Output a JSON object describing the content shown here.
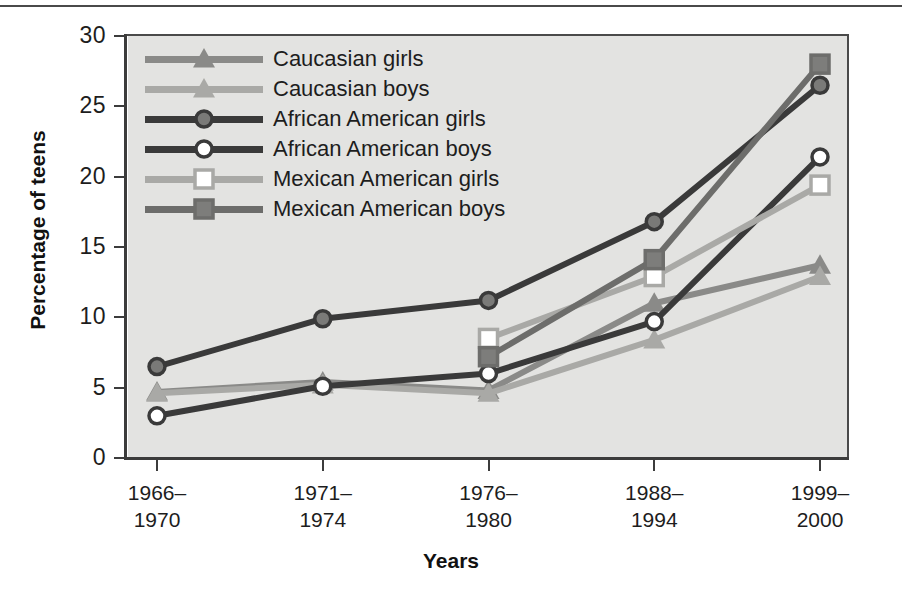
{
  "chart_data": {
    "type": "line",
    "title": "",
    "xlabel": "Years",
    "ylabel": "Percentage of teens",
    "categories": [
      "1966–1970",
      "1971–1974",
      "1976–1980",
      "1988–1994",
      "1999–2000"
    ],
    "category_lines": [
      [
        "1966–",
        "1970"
      ],
      [
        "1971–",
        "1974"
      ],
      [
        "1976–",
        "1980"
      ],
      [
        "1988–",
        "1994"
      ],
      [
        "1999–",
        "2000"
      ]
    ],
    "ylim": [
      0,
      30
    ],
    "yticks": [
      0,
      5,
      10,
      15,
      20,
      25,
      30
    ],
    "ytick_labels": [
      "0",
      "5",
      "10",
      "15",
      "20",
      "25",
      "30"
    ],
    "grid": false,
    "legend_position": "upper-left-inside",
    "series": [
      {
        "name": "Caucasian girls",
        "marker": "triangle",
        "marker_fill": "solid",
        "color": "#8a8a88",
        "values": [
          4.7,
          5.4,
          4.8,
          11.0,
          13.7
        ]
      },
      {
        "name": "Caucasian boys",
        "marker": "triangle",
        "marker_fill": "solid",
        "color": "#a9a9a6",
        "values": [
          4.6,
          5.2,
          4.6,
          8.4,
          12.9
        ]
      },
      {
        "name": "African American girls",
        "marker": "circle",
        "marker_fill": "solid",
        "color": "#3a3a3a",
        "values": [
          6.5,
          9.9,
          11.2,
          16.8,
          26.5
        ]
      },
      {
        "name": "African American boys",
        "marker": "circle",
        "marker_fill": "open",
        "color": "#3a3a3a",
        "values": [
          3.0,
          5.1,
          6.0,
          9.7,
          21.4
        ]
      },
      {
        "name": "Mexican American girls",
        "marker": "square",
        "marker_fill": "open",
        "color": "#a9a9a6",
        "values": [
          null,
          null,
          8.5,
          12.9,
          19.4
        ]
      },
      {
        "name": "Mexican American boys",
        "marker": "square",
        "marker_fill": "solid",
        "color": "#6d6d6b",
        "values": [
          null,
          null,
          7.2,
          14.1,
          28.0
        ]
      }
    ]
  },
  "legend": {
    "items": [
      "Caucasian girls",
      "Caucasian boys",
      "African American girls",
      "African American boys",
      "Mexican American girls",
      "Mexican American boys"
    ]
  },
  "axes": {
    "y_title": "Percentage of teens",
    "x_title": "Years"
  },
  "colors": {
    "plot_background": "#e3e3e1",
    "axis": "#3c3c3c",
    "text": "#1d1d1d"
  }
}
